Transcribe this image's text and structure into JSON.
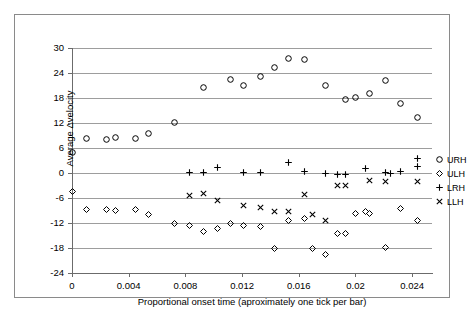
{
  "chart_data": {
    "type": "scatter",
    "title": "",
    "xlabel": "Proportional onset time (aproximately one tick per bar)",
    "ylabel": "Average Δvelocity",
    "xlim": [
      0,
      0.0254
    ],
    "ylim": [
      -24,
      30
    ],
    "xticks": [
      "0",
      "0.004",
      "0.008",
      "0.012",
      "0.016",
      "0.02",
      "0.024"
    ],
    "xtick_values": [
      0,
      0.004,
      0.008,
      0.012,
      0.016,
      0.02,
      0.024
    ],
    "yticks": [
      "30",
      "24",
      "18",
      "12",
      "6",
      "0",
      "-6",
      "-12",
      "-18",
      "-24"
    ],
    "ytick_values": [
      30,
      24,
      18,
      12,
      6,
      0,
      -6,
      -12,
      -18,
      -24
    ],
    "grid": "horizontal",
    "legend_position": "right",
    "series": [
      {
        "name": "URH",
        "marker": "circle",
        "color": "#000000",
        "points": [
          [
            0.0,
            5.0
          ],
          [
            0.001,
            8.2
          ],
          [
            0.0024,
            8.0
          ],
          [
            0.0031,
            8.6
          ],
          [
            0.0045,
            8.2
          ],
          [
            0.0054,
            9.6
          ],
          [
            0.0072,
            12.2
          ],
          [
            0.0093,
            20.6
          ],
          [
            0.0112,
            22.4
          ],
          [
            0.0121,
            21.1
          ],
          [
            0.0133,
            23.2
          ],
          [
            0.0143,
            25.4
          ],
          [
            0.0153,
            27.4
          ],
          [
            0.0164,
            27.2
          ],
          [
            0.0179,
            21.1
          ],
          [
            0.0193,
            17.6
          ],
          [
            0.02,
            18.2
          ],
          [
            0.021,
            19.0
          ],
          [
            0.0221,
            22.3
          ],
          [
            0.0232,
            16.7
          ],
          [
            0.0244,
            13.4
          ]
        ]
      },
      {
        "name": "ULH",
        "marker": "diamond",
        "color": "#000000",
        "points": [
          [
            0.0,
            -4.4
          ],
          [
            0.001,
            -8.7
          ],
          [
            0.0024,
            -8.7
          ],
          [
            0.0031,
            -8.9
          ],
          [
            0.0045,
            -8.7
          ],
          [
            0.0054,
            -10.0
          ],
          [
            0.0072,
            -12.0
          ],
          [
            0.0083,
            -12.7
          ],
          [
            0.0093,
            -14.1
          ],
          [
            0.0103,
            -13.2
          ],
          [
            0.0112,
            -12.0
          ],
          [
            0.0121,
            -12.5
          ],
          [
            0.0133,
            -12.8
          ],
          [
            0.0143,
            -18.2
          ],
          [
            0.0153,
            -11.3
          ],
          [
            0.0164,
            -11.0
          ],
          [
            0.017,
            -18.1
          ],
          [
            0.0179,
            -19.5
          ],
          [
            0.0187,
            -14.6
          ],
          [
            0.0193,
            -14.4
          ],
          [
            0.02,
            -9.6
          ],
          [
            0.0207,
            -9.2
          ],
          [
            0.021,
            -9.6
          ],
          [
            0.0221,
            -17.8
          ],
          [
            0.0232,
            -8.5
          ],
          [
            0.0244,
            -11.3
          ]
        ]
      },
      {
        "name": "LRH",
        "marker": "plus",
        "color": "#000000",
        "points": [
          [
            0.0083,
            0.2
          ],
          [
            0.0093,
            0.1
          ],
          [
            0.0103,
            1.3
          ],
          [
            0.0121,
            0.2
          ],
          [
            0.0133,
            0.2
          ],
          [
            0.0153,
            2.5
          ],
          [
            0.0164,
            0.3
          ],
          [
            0.0179,
            0.0
          ],
          [
            0.0187,
            -0.4
          ],
          [
            0.0193,
            -0.4
          ],
          [
            0.0207,
            1.2
          ],
          [
            0.0221,
            0.2
          ],
          [
            0.0225,
            0.0
          ],
          [
            0.0232,
            0.3
          ],
          [
            0.0244,
            3.5
          ],
          [
            0.0244,
            1.5
          ]
        ]
      },
      {
        "name": "LLH",
        "marker": "cross",
        "color": "#000000",
        "points": [
          [
            0.0083,
            -5.4
          ],
          [
            0.0093,
            -5.0
          ],
          [
            0.0103,
            -6.7
          ],
          [
            0.0121,
            -7.9
          ],
          [
            0.0133,
            -8.3
          ],
          [
            0.0143,
            -9.3
          ],
          [
            0.0153,
            -9.2
          ],
          [
            0.0164,
            -5.2
          ],
          [
            0.017,
            -9.9
          ],
          [
            0.0179,
            -11.3
          ],
          [
            0.0187,
            -3.0
          ],
          [
            0.0193,
            -3.0
          ],
          [
            0.021,
            -1.8
          ],
          [
            0.0221,
            -2.0
          ],
          [
            0.0244,
            -2.0
          ]
        ]
      }
    ]
  },
  "legend": {
    "items": [
      {
        "label": "URH",
        "marker": "circle"
      },
      {
        "label": "ULH",
        "marker": "diamond"
      },
      {
        "label": "LRH",
        "marker": "plus"
      },
      {
        "label": "LLH",
        "marker": "cross"
      }
    ]
  }
}
